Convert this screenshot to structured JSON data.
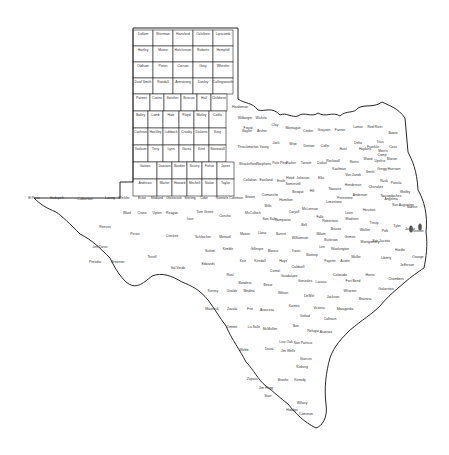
{
  "map": {
    "title": "Texas Counties",
    "colors": {
      "stroke": "#222222",
      "fill": "#ffffff",
      "label": "#333333",
      "marker": "#555555"
    },
    "panhandle_grid": {
      "x0": 133,
      "y0": 30,
      "col_w": 20,
      "row_h": 16,
      "rows": [
        [
          "Dallam",
          "Sherman",
          "Hansford",
          "Ochiltree",
          "Lipscomb"
        ],
        [
          "Hartley",
          "Moore",
          "Hutchinson",
          "Roberts",
          "Hemphill"
        ],
        [
          "Oldham",
          "Potter",
          "Carson",
          "Gray",
          "Wheeler"
        ],
        [
          "Deaf Smith",
          "Randall",
          "Armstrong",
          "Donley",
          "Collingsworth"
        ]
      ]
    },
    "grid_rows": [
      {
        "y": 94,
        "x0": 133,
        "w": [
          17,
          14,
          17,
          16,
          14,
          16
        ],
        "names": [
          "Parmer",
          "Castro",
          "Swisher",
          "Briscoe",
          "Hall",
          "Childress"
        ]
      },
      {
        "y": 111,
        "x0": 133,
        "w": [
          15,
          15,
          16,
          15,
          15,
          17
        ],
        "names": [
          "Bailey",
          "Lamb",
          "Hale",
          "Floyd",
          "Motley",
          "Cottle"
        ]
      },
      {
        "y": 128,
        "x0": 133,
        "w": [
          15,
          15,
          16,
          15,
          15,
          17
        ],
        "names": [
          "Cochran",
          "Hockley",
          "Lubbock",
          "Crosby",
          "Dickens",
          "King"
        ]
      },
      {
        "y": 145,
        "x0": 133,
        "w": [
          15,
          15,
          16,
          15,
          15,
          17
        ],
        "names": [
          "Yoakum",
          "Terry",
          "Lynn",
          "Garza",
          "Kent",
          "Stonewall"
        ]
      },
      {
        "y": 162,
        "x0": 133,
        "w": [
          24,
          15,
          15,
          15,
          15,
          17
        ],
        "names": [
          "Gaines",
          "Dawson",
          "Borden",
          "Scurry",
          "Fisher",
          "Jones"
        ]
      },
      {
        "y": 179,
        "x0": 133,
        "w": [
          24,
          15,
          15,
          15,
          15,
          17
        ],
        "names": [
          "Andrews",
          "Martin",
          "Howard",
          "Mitchell",
          "Nolan",
          "Taylor"
        ]
      }
    ],
    "west_labels": [
      {
        "name": "El Paso",
        "x": 34,
        "y": 199
      },
      {
        "name": "Hudspeth",
        "x": 57,
        "y": 199
      },
      {
        "name": "Culberson",
        "x": 85,
        "y": 200
      },
      {
        "name": "Loving",
        "x": 110,
        "y": 199
      },
      {
        "name": "Winkler",
        "x": 124,
        "y": 199
      },
      {
        "name": "Ector",
        "x": 142,
        "y": 199
      },
      {
        "name": "Midland",
        "x": 157,
        "y": 199
      },
      {
        "name": "Glasscock",
        "x": 174,
        "y": 199
      },
      {
        "name": "Sterling",
        "x": 190,
        "y": 199
      },
      {
        "name": "Coke",
        "x": 204,
        "y": 199
      },
      {
        "name": "Runnels",
        "x": 222,
        "y": 199
      },
      {
        "name": "Coleman",
        "x": 236,
        "y": 199
      },
      {
        "name": "Reeves",
        "x": 105,
        "y": 228
      },
      {
        "name": "Ward",
        "x": 127,
        "y": 214
      },
      {
        "name": "Crane",
        "x": 142,
        "y": 214
      },
      {
        "name": "Upton",
        "x": 157,
        "y": 214
      },
      {
        "name": "Reagan",
        "x": 172,
        "y": 214
      },
      {
        "name": "Irion",
        "x": 190,
        "y": 220
      },
      {
        "name": "Tom Green",
        "x": 205,
        "y": 213
      },
      {
        "name": "Concho",
        "x": 225,
        "y": 217
      },
      {
        "name": "Pecos",
        "x": 135,
        "y": 235
      },
      {
        "name": "Jeff Davis",
        "x": 100,
        "y": 248
      },
      {
        "name": "Presidio",
        "x": 95,
        "y": 263
      },
      {
        "name": "Brewster",
        "x": 118,
        "y": 263
      },
      {
        "name": "Crockett",
        "x": 172,
        "y": 237
      },
      {
        "name": "Schleicher",
        "x": 203,
        "y": 238
      },
      {
        "name": "Menard",
        "x": 225,
        "y": 238
      },
      {
        "name": "Sutton",
        "x": 210,
        "y": 252
      },
      {
        "name": "Kimble",
        "x": 228,
        "y": 250
      },
      {
        "name": "Terrell",
        "x": 152,
        "y": 258
      },
      {
        "name": "Val Verde",
        "x": 178,
        "y": 269
      },
      {
        "name": "Edwards",
        "x": 208,
        "y": 265
      },
      {
        "name": "Real",
        "x": 230,
        "y": 276
      },
      {
        "name": "Bandera",
        "x": 245,
        "y": 284
      },
      {
        "name": "Kinney",
        "x": 213,
        "y": 292
      },
      {
        "name": "Uvalde",
        "x": 232,
        "y": 292
      },
      {
        "name": "Medina",
        "x": 249,
        "y": 292
      },
      {
        "name": "Maverick",
        "x": 212,
        "y": 310
      },
      {
        "name": "Zavala",
        "x": 232,
        "y": 310
      },
      {
        "name": "Frio",
        "x": 250,
        "y": 310
      },
      {
        "name": "Atascosa",
        "x": 267,
        "y": 311
      },
      {
        "name": "Dimmit",
        "x": 232,
        "y": 328
      },
      {
        "name": "La Salle",
        "x": 254,
        "y": 328
      },
      {
        "name": "McMullen",
        "x": 270,
        "y": 330
      },
      {
        "name": "Live Oak",
        "x": 286,
        "y": 343
      },
      {
        "name": "Webb",
        "x": 244,
        "y": 351
      },
      {
        "name": "Duval",
        "x": 269,
        "y": 350
      },
      {
        "name": "Jim Wells",
        "x": 288,
        "y": 352
      },
      {
        "name": "Zapata",
        "x": 252,
        "y": 380
      },
      {
        "name": "Jim Hogg",
        "x": 266,
        "y": 389
      },
      {
        "name": "Brooks",
        "x": 283,
        "y": 381
      },
      {
        "name": "Kenedy",
        "x": 300,
        "y": 381
      },
      {
        "name": "Kleberg",
        "x": 302,
        "y": 368
      },
      {
        "name": "Nueces",
        "x": 306,
        "y": 360
      },
      {
        "name": "Starr",
        "x": 268,
        "y": 397
      },
      {
        "name": "Hidalgo",
        "x": 292,
        "y": 411
      },
      {
        "name": "Willacy",
        "x": 302,
        "y": 404
      },
      {
        "name": "Cameron",
        "x": 306,
        "y": 415
      },
      {
        "name": "Bee",
        "x": 296,
        "y": 327
      },
      {
        "name": "San Patricio",
        "x": 303,
        "y": 344
      },
      {
        "name": "Refugio",
        "x": 313,
        "y": 332
      }
    ],
    "central_labels": [
      {
        "name": "Callahan",
        "x": 250,
        "y": 181
      },
      {
        "name": "Eastland",
        "x": 266,
        "y": 181
      },
      {
        "name": "Erath",
        "x": 281,
        "y": 182
      },
      {
        "name": "Shackelford",
        "x": 248,
        "y": 165
      },
      {
        "name": "Stephens",
        "x": 264,
        "y": 165
      },
      {
        "name": "Palo Pinto",
        "x": 280,
        "y": 164
      },
      {
        "name": "Throckmorton",
        "x": 248,
        "y": 148
      },
      {
        "name": "Young",
        "x": 264,
        "y": 148
      },
      {
        "name": "Jack",
        "x": 276,
        "y": 144
      },
      {
        "name": "Wise",
        "x": 293,
        "y": 145
      },
      {
        "name": "Denton",
        "x": 309,
        "y": 147
      },
      {
        "name": "Collin",
        "x": 325,
        "y": 147
      },
      {
        "name": "Hunt",
        "x": 343,
        "y": 150
      },
      {
        "name": "Baylor",
        "x": 247,
        "y": 132
      },
      {
        "name": "Archer",
        "x": 262,
        "y": 132
      },
      {
        "name": "Clay",
        "x": 275,
        "y": 126
      },
      {
        "name": "Wilbarger",
        "x": 245,
        "y": 119
      },
      {
        "name": "Wichita",
        "x": 261,
        "y": 119
      },
      {
        "name": "Hardeman",
        "x": 240,
        "y": 108
      },
      {
        "name": "Foard",
        "x": 248,
        "y": 129
      },
      {
        "name": "Montague",
        "x": 293,
        "y": 129
      },
      {
        "name": "Cooke",
        "x": 308,
        "y": 132
      },
      {
        "name": "Grayson",
        "x": 324,
        "y": 131
      },
      {
        "name": "Fannin",
        "x": 340,
        "y": 131
      },
      {
        "name": "Lamar",
        "x": 358,
        "y": 128
      },
      {
        "name": "Red River",
        "x": 375,
        "y": 128
      },
      {
        "name": "Bowie",
        "x": 393,
        "y": 134
      },
      {
        "name": "Parker",
        "x": 291,
        "y": 164
      },
      {
        "name": "Tarrant",
        "x": 306,
        "y": 164
      },
      {
        "name": "Dallas",
        "x": 322,
        "y": 164
      },
      {
        "name": "Kaufman",
        "x": 339,
        "y": 170
      },
      {
        "name": "Hood",
        "x": 290,
        "y": 179
      },
      {
        "name": "Johnson",
        "x": 303,
        "y": 179
      },
      {
        "name": "Ellis",
        "x": 321,
        "y": 179
      },
      {
        "name": "Rockwall",
        "x": 333,
        "y": 162
      },
      {
        "name": "Rains",
        "x": 354,
        "y": 163
      },
      {
        "name": "Hopkins",
        "x": 365,
        "y": 150
      },
      {
        "name": "Delta",
        "x": 358,
        "y": 144
      },
      {
        "name": "Franklin",
        "x": 373,
        "y": 148
      },
      {
        "name": "Titus",
        "x": 380,
        "y": 143
      },
      {
        "name": "Morris",
        "x": 383,
        "y": 152
      },
      {
        "name": "Cass",
        "x": 393,
        "y": 148
      },
      {
        "name": "Camp",
        "x": 382,
        "y": 156
      },
      {
        "name": "Wood",
        "x": 368,
        "y": 160
      },
      {
        "name": "Upshur",
        "x": 380,
        "y": 162
      },
      {
        "name": "Marion",
        "x": 392,
        "y": 160
      },
      {
        "name": "Harrison",
        "x": 394,
        "y": 170
      },
      {
        "name": "Gregg",
        "x": 382,
        "y": 170
      },
      {
        "name": "Smith",
        "x": 370,
        "y": 173
      },
      {
        "name": "Van Zandt",
        "x": 353,
        "y": 176
      },
      {
        "name": "Henderson",
        "x": 353,
        "y": 186
      },
      {
        "name": "Rusk",
        "x": 384,
        "y": 182
      },
      {
        "name": "Panola",
        "x": 396,
        "y": 184
      },
      {
        "name": "Cherokee",
        "x": 376,
        "y": 188
      },
      {
        "name": "Anderson",
        "x": 360,
        "y": 196
      },
      {
        "name": "Navarro",
        "x": 335,
        "y": 190
      },
      {
        "name": "Hill",
        "x": 312,
        "y": 192
      },
      {
        "name": "Bosque",
        "x": 298,
        "y": 193
      },
      {
        "name": "Somervell",
        "x": 293,
        "y": 185
      },
      {
        "name": "Comanche",
        "x": 270,
        "y": 196
      },
      {
        "name": "Brown",
        "x": 250,
        "y": 198
      },
      {
        "name": "Mills",
        "x": 268,
        "y": 207
      },
      {
        "name": "Hamilton",
        "x": 286,
        "y": 201
      },
      {
        "name": "Coryell",
        "x": 294,
        "y": 213
      },
      {
        "name": "McLennan",
        "x": 310,
        "y": 210
      },
      {
        "name": "Limestone",
        "x": 334,
        "y": 203
      },
      {
        "name": "Freestone",
        "x": 345,
        "y": 199
      },
      {
        "name": "Leon",
        "x": 349,
        "y": 214
      },
      {
        "name": "Houston",
        "x": 369,
        "y": 211
      },
      {
        "name": "Trinity",
        "x": 374,
        "y": 224
      },
      {
        "name": "Angelina",
        "x": 391,
        "y": 200
      },
      {
        "name": "Nacogdoches",
        "x": 391,
        "y": 197
      },
      {
        "name": "Shelby",
        "x": 405,
        "y": 193
      },
      {
        "name": "San Augustine",
        "x": 403,
        "y": 206
      },
      {
        "name": "Sabine",
        "x": 412,
        "y": 208
      },
      {
        "name": "Polk",
        "x": 385,
        "y": 232
      },
      {
        "name": "Tyler",
        "x": 397,
        "y": 227
      },
      {
        "name": "Jasper",
        "x": 410,
        "y": 230
      },
      {
        "name": "Newton",
        "x": 418,
        "y": 232
      },
      {
        "name": "Hardin",
        "x": 400,
        "y": 251
      },
      {
        "name": "Orange",
        "x": 418,
        "y": 258
      },
      {
        "name": "Jefferson",
        "x": 407,
        "y": 266
      },
      {
        "name": "Liberty",
        "x": 386,
        "y": 259
      },
      {
        "name": "Chambers",
        "x": 396,
        "y": 280
      },
      {
        "name": "Harris",
        "x": 370,
        "y": 276
      },
      {
        "name": "Galveston",
        "x": 386,
        "y": 290
      },
      {
        "name": "Brazoria",
        "x": 365,
        "y": 300
      },
      {
        "name": "Fort Bend",
        "x": 353,
        "y": 282
      },
      {
        "name": "Montgomery",
        "x": 370,
        "y": 243
      },
      {
        "name": "San Jacinto",
        "x": 381,
        "y": 242
      },
      {
        "name": "Walker",
        "x": 365,
        "y": 231
      },
      {
        "name": "Madison",
        "x": 352,
        "y": 220
      },
      {
        "name": "Robertson",
        "x": 330,
        "y": 222
      },
      {
        "name": "Falls",
        "x": 320,
        "y": 218
      },
      {
        "name": "Bell",
        "x": 304,
        "y": 226
      },
      {
        "name": "Lampasas",
        "x": 283,
        "y": 221
      },
      {
        "name": "San Saba",
        "x": 270,
        "y": 220
      },
      {
        "name": "McCulloch",
        "x": 253,
        "y": 214
      },
      {
        "name": "Mason",
        "x": 245,
        "y": 235
      },
      {
        "name": "Llano",
        "x": 262,
        "y": 234
      },
      {
        "name": "Burnet",
        "x": 281,
        "y": 235
      },
      {
        "name": "Williamson",
        "x": 300,
        "y": 239
      },
      {
        "name": "Milam",
        "x": 321,
        "y": 235
      },
      {
        "name": "Brazos",
        "x": 336,
        "y": 230
      },
      {
        "name": "Grimes",
        "x": 350,
        "y": 238
      },
      {
        "name": "Burleson",
        "x": 331,
        "y": 241
      },
      {
        "name": "Lee",
        "x": 322,
        "y": 248
      },
      {
        "name": "Washington",
        "x": 340,
        "y": 250
      },
      {
        "name": "Waller",
        "x": 356,
        "y": 258
      },
      {
        "name": "Austin",
        "x": 345,
        "y": 262
      },
      {
        "name": "Travis",
        "x": 296,
        "y": 252
      },
      {
        "name": "Bastrop",
        "x": 312,
        "y": 256
      },
      {
        "name": "Fayette",
        "x": 330,
        "y": 262
      },
      {
        "name": "Colorado",
        "x": 340,
        "y": 276
      },
      {
        "name": "Wharton",
        "x": 350,
        "y": 292
      },
      {
        "name": "Matagorda",
        "x": 345,
        "y": 310
      },
      {
        "name": "Blanco",
        "x": 273,
        "y": 252
      },
      {
        "name": "Gillespie",
        "x": 257,
        "y": 250
      },
      {
        "name": "Kerr",
        "x": 243,
        "y": 262
      },
      {
        "name": "Kendall",
        "x": 260,
        "y": 262
      },
      {
        "name": "Hays",
        "x": 283,
        "y": 262
      },
      {
        "name": "Caldwell",
        "x": 298,
        "y": 268
      },
      {
        "name": "Comal",
        "x": 275,
        "y": 272
      },
      {
        "name": "Guadalupe",
        "x": 289,
        "y": 277
      },
      {
        "name": "Gonzales",
        "x": 305,
        "y": 282
      },
      {
        "name": "Lavaca",
        "x": 321,
        "y": 283
      },
      {
        "name": "Jackson",
        "x": 333,
        "y": 298
      },
      {
        "name": "Bexar",
        "x": 268,
        "y": 286
      },
      {
        "name": "Wilson",
        "x": 283,
        "y": 294
      },
      {
        "name": "Karnes",
        "x": 294,
        "y": 307
      },
      {
        "name": "DeWitt",
        "x": 309,
        "y": 297
      },
      {
        "name": "Victoria",
        "x": 319,
        "y": 309
      },
      {
        "name": "Goliad",
        "x": 305,
        "y": 317
      },
      {
        "name": "Calhoun",
        "x": 330,
        "y": 320
      },
      {
        "name": "Aransas",
        "x": 326,
        "y": 333
      }
    ],
    "markers": [
      {
        "name": "lake-marker-1",
        "x": 411,
        "y": 229
      },
      {
        "name": "lake-marker-2",
        "x": 420,
        "y": 227
      }
    ]
  }
}
